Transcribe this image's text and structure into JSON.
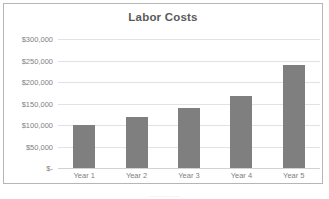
{
  "chart_data": {
    "type": "bar",
    "title": "Labor Costs",
    "xlabel": "",
    "ylabel": "",
    "categories": [
      "Year 1",
      "Year 2",
      "Year 3",
      "Year 4",
      "Year 5"
    ],
    "values": [
      100000,
      118000,
      140000,
      168000,
      240000
    ],
    "ylim": [
      0,
      300000
    ],
    "y_ticks": [
      0,
      50000,
      100000,
      150000,
      200000,
      250000,
      300000
    ],
    "y_tick_labels": [
      "$-",
      "$50,000",
      "$100,000",
      "$150,000",
      "$200,000",
      "$250,000",
      "$300,000"
    ],
    "grid": true,
    "legend": false,
    "series": [
      {
        "name": "Labor Costs",
        "values": [
          100000,
          118000,
          140000,
          168000,
          240000
        ],
        "color": "#7f7f7f"
      }
    ]
  },
  "colors": {
    "bar_fill": "#7f7f7f",
    "gridline": "#e2e2e2",
    "border": "#b6b6b6",
    "title_text": "#5a5a5a",
    "axis_text": "#808080",
    "background": "#ffffff"
  },
  "footer": {
    "clipped_text": "·············"
  }
}
